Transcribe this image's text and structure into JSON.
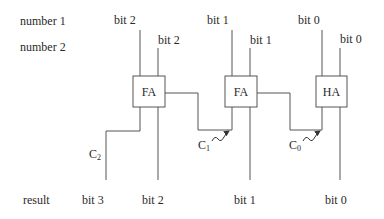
{
  "diagram": {
    "type": "ripple-carry-adder",
    "row_labels": {
      "number1": "number 1",
      "number2": "number 2",
      "result": "result"
    },
    "inputs_number1": [
      "bit 2",
      "bit 1",
      "bit 0"
    ],
    "inputs_number2": [
      "bit 2",
      "bit 1",
      "bit 0"
    ],
    "blocks": [
      {
        "id": "fa-bit2",
        "label": "FA"
      },
      {
        "id": "fa-bit1",
        "label": "FA"
      },
      {
        "id": "ha-bit0",
        "label": "HA"
      }
    ],
    "carries": [
      {
        "letter": "C",
        "sub": "2"
      },
      {
        "letter": "C",
        "sub": "1"
      },
      {
        "letter": "C",
        "sub": "0"
      }
    ],
    "outputs": [
      "bit 3",
      "bit 2",
      "bit 1",
      "bit 0"
    ],
    "colors": {
      "line": "#555555",
      "text": "#2a2a2a",
      "background": "#ffffff"
    }
  }
}
